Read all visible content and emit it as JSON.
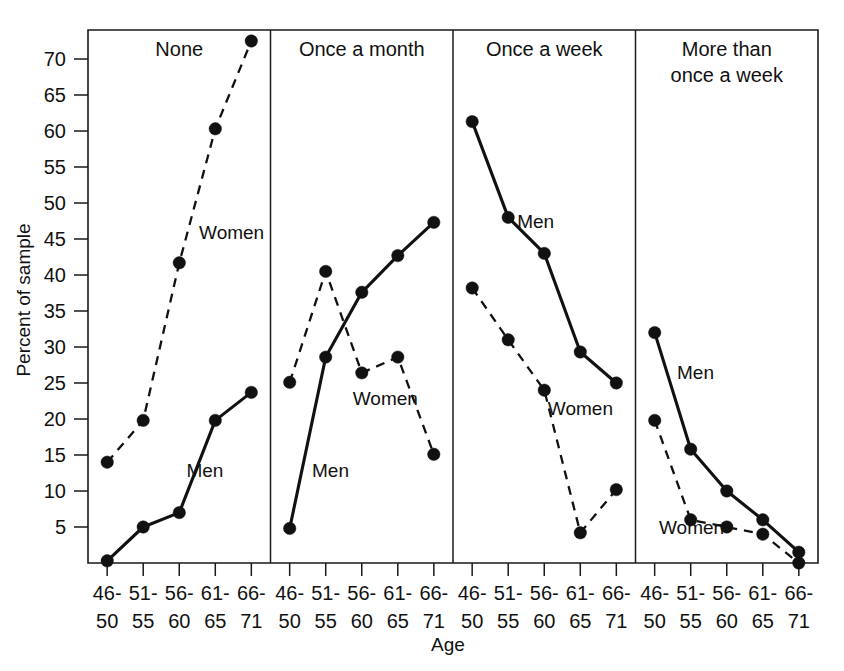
{
  "chart_data": {
    "type": "line",
    "title": "",
    "xlabel": "Age",
    "ylabel": "Percent of sample",
    "ylim": [
      0,
      75
    ],
    "ytick_labels": [
      "5",
      "10",
      "15",
      "20",
      "25",
      "30",
      "35",
      "40",
      "45",
      "50",
      "55",
      "60",
      "65",
      "70"
    ],
    "yticks": [
      5,
      10,
      15,
      20,
      25,
      30,
      35,
      40,
      45,
      50,
      55,
      60,
      65,
      70
    ],
    "categories": [
      "46-\n50",
      "51-\n55",
      "56-\n60",
      "61-\n65",
      "66-\n71"
    ],
    "category_lines": [
      [
        "46-",
        "50"
      ],
      [
        "51-",
        "55"
      ],
      [
        "56-",
        "60"
      ],
      [
        "61-",
        "65"
      ],
      [
        "66-",
        "71"
      ]
    ],
    "grid": false,
    "legend_position": "inline-annotations",
    "panels": [
      {
        "title": "None",
        "title_lines": [
          "None"
        ],
        "series": [
          {
            "name": "Women",
            "style": "dashed",
            "label": "Women",
            "label_x_index": 2.55,
            "label_y": 45.0,
            "values": [
              14.0,
              19.8,
              41.7,
              60.3,
              72.5
            ]
          },
          {
            "name": "Men",
            "style": "solid",
            "label": "Men",
            "label_x_index": 2.2,
            "label_y": 12.0,
            "values": [
              0.3,
              5.0,
              7.0,
              19.8,
              23.7
            ]
          }
        ]
      },
      {
        "title": "Once a month",
        "title_lines": [
          "Once a month"
        ],
        "series": [
          {
            "name": "Women",
            "style": "dashed",
            "label": "Women",
            "label_x_index": 1.75,
            "label_y": 22.0,
            "values": [
              25.1,
              40.5,
              26.4,
              28.6,
              15.1
            ]
          },
          {
            "name": "Men",
            "style": "solid",
            "label": "Men",
            "label_x_index": 0.62,
            "label_y": 12.0,
            "values": [
              4.8,
              28.6,
              37.6,
              42.7,
              47.3
            ]
          }
        ]
      },
      {
        "title": "Once a week",
        "title_lines": [
          "Once a week"
        ],
        "series": [
          {
            "name": "Men",
            "style": "solid",
            "label": "Men",
            "label_x_index": 1.25,
            "label_y": 46.5,
            "values": [
              61.3,
              48.0,
              43.0,
              29.3,
              25.0
            ]
          },
          {
            "name": "Women",
            "style": "dashed",
            "label": "Women",
            "label_x_index": 2.1,
            "label_y": 20.5,
            "values": [
              38.2,
              31.0,
              24.0,
              4.2,
              10.2
            ]
          }
        ]
      },
      {
        "title": "More than once a week",
        "title_lines": [
          "More than",
          "once a week"
        ],
        "series": [
          {
            "name": "Men",
            "style": "solid",
            "label": "Men",
            "label_x_index": 0.62,
            "label_y": 25.5,
            "values": [
              32.0,
              15.8,
              10.0,
              6.0,
              1.5
            ]
          },
          {
            "name": "Women",
            "style": "dashed",
            "label": "Women",
            "label_x_index": 0.12,
            "label_y": 4.0,
            "values": [
              19.8,
              6.0,
              5.0,
              4.0,
              0.0
            ]
          }
        ]
      }
    ]
  }
}
